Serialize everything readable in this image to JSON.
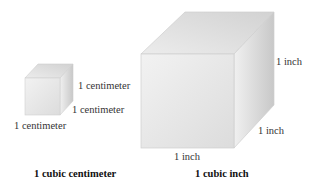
{
  "figure": {
    "small_cube": {
      "labels": {
        "right": "1 centimeter",
        "depth": "1 centimeter",
        "bottom": "1 centimeter"
      },
      "caption": "1 cubic centimeter"
    },
    "large_cube": {
      "labels": {
        "right": "1 inch",
        "depth": "1 inch",
        "bottom": "1 inch"
      },
      "caption": "1 cubic inch"
    },
    "colors": {
      "front_face": "#e6e6e6",
      "top_face": "#dadada",
      "side_face": "#cfcfcf",
      "edge": "#c4c4c4"
    }
  }
}
